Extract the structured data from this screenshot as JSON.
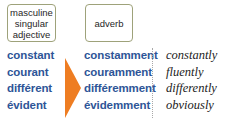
{
  "headers": {
    "adjective": [
      "masculine",
      "singular",
      "adjective"
    ],
    "adverb": "adverb"
  },
  "rows": [
    {
      "adjective": "constant",
      "adverb": "constamment",
      "english": "constantly"
    },
    {
      "adjective": "courant",
      "adverb": "couramment",
      "english": "fluently"
    },
    {
      "adjective": "différent",
      "adverb": "différemment",
      "english": "differently"
    },
    {
      "adjective": "évident",
      "adverb": "évidemment",
      "english": "obviously"
    }
  ],
  "colors": {
    "french_text": "#2e5597",
    "arrow": "#ee7d22",
    "box_border": "#9ea27a",
    "english_text": "#222222"
  }
}
